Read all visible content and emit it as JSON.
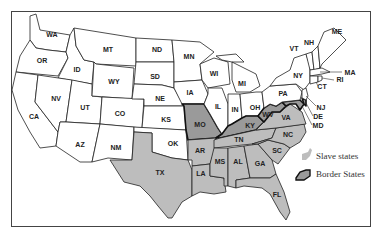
{
  "map": {
    "title": "",
    "colors": {
      "free": "#ffffff",
      "slave": "#bdbdbd",
      "border": "#9a9a9a",
      "outline": "#222222"
    },
    "states": {
      "WA": "WA",
      "OR": "OR",
      "CA": "CA",
      "ID": "ID",
      "NV": "NV",
      "UT": "UT",
      "AZ": "AZ",
      "MT": "MT",
      "WY": "WY",
      "CO": "CO",
      "NM": "NM",
      "ND": "ND",
      "SD": "SD",
      "NE": "NE",
      "KS": "KS",
      "OK": "OK",
      "TX": "TX",
      "MN": "MN",
      "IA": "IA",
      "MO": "MO",
      "AR": "AR",
      "LA": "LA",
      "WI": "WI",
      "IL": "IL",
      "MI": "MI",
      "IN": "IN",
      "OH": "OH",
      "KY": "KY",
      "TN": "TN",
      "MS": "MS",
      "AL": "AL",
      "GA": "GA",
      "FL": "FL",
      "SC": "SC",
      "NC": "NC",
      "VA": "VA",
      "WV": "WV",
      "PA": "PA",
      "NY": "NY",
      "VT": "VT",
      "NH": "NH",
      "ME": "ME",
      "MA": "MA",
      "RI": "RI",
      "CT": "CT",
      "NJ": "NJ",
      "DE": "DE",
      "MD": "MD"
    },
    "slave_states": [
      "TX",
      "AR",
      "LA",
      "MS",
      "AL",
      "GA",
      "FL",
      "SC",
      "NC",
      "TN",
      "VA"
    ],
    "border_states": [
      "MO",
      "KY",
      "WV",
      "MD",
      "DE"
    ],
    "legend": {
      "slave_label": "Slave states",
      "border_label": "Border States"
    }
  }
}
